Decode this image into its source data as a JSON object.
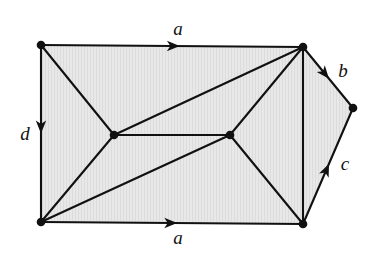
{
  "figure": {
    "name": "triangulated-polygon-with-identified-edges",
    "width": 377,
    "height": 253,
    "background_color": "#ffffff",
    "face_fill_color": "#e6e6e6",
    "stroke_color": "#111111"
  },
  "vertices": [
    {
      "id": "top-left",
      "x": 41,
      "y": 45,
      "label": ""
    },
    {
      "id": "top-right",
      "x": 303,
      "y": 47,
      "label": ""
    },
    {
      "id": "right",
      "x": 353,
      "y": 108,
      "label": ""
    },
    {
      "id": "bottom-right",
      "x": 303,
      "y": 224,
      "label": ""
    },
    {
      "id": "bottom-left",
      "x": 41,
      "y": 222,
      "label": ""
    },
    {
      "id": "interior-left",
      "x": 114,
      "y": 135,
      "label": ""
    },
    {
      "id": "interior-right",
      "x": 230,
      "y": 135,
      "label": ""
    }
  ],
  "boundary_path": "41,45 303,47 353,108 303,224 41,222",
  "edges": [
    {
      "id": "edge-top",
      "from": "top-left",
      "to": "top-right",
      "label": "a",
      "directed": true,
      "arrow_at": 0.53,
      "label_x": 178,
      "label_y": 31
    },
    {
      "id": "edge-bottom",
      "from": "bottom-left",
      "to": "bottom-right",
      "label": "a",
      "directed": true,
      "arrow_at": 0.52,
      "label_x": 178,
      "label_y": 240
    },
    {
      "id": "edge-left",
      "from": "top-left",
      "to": "bottom-left",
      "label": "d",
      "directed": true,
      "arrow_at": 0.5,
      "label_x": 25,
      "label_y": 136
    },
    {
      "id": "edge-upper-right",
      "from": "top-right",
      "to": "right",
      "label": "b",
      "directed": true,
      "arrow_at": 0.52,
      "label_x": 343,
      "label_y": 73
    },
    {
      "id": "edge-lower-right",
      "from": "bottom-right",
      "to": "right",
      "label": "c",
      "directed": true,
      "arrow_at": 0.52,
      "label_x": 345,
      "label_y": 166
    },
    {
      "id": "edge-right-vertical",
      "from": "top-right",
      "to": "bottom-right",
      "label": "",
      "directed": false
    },
    {
      "id": "edge-tl-il",
      "from": "top-left",
      "to": "interior-left",
      "label": "",
      "directed": false
    },
    {
      "id": "edge-tr-il",
      "from": "top-right",
      "to": "interior-left",
      "label": "",
      "directed": false
    },
    {
      "id": "edge-tr-ir",
      "from": "top-right",
      "to": "interior-right",
      "label": "",
      "directed": false
    },
    {
      "id": "edge-il-ir",
      "from": "interior-left",
      "to": "interior-right",
      "label": "",
      "directed": false
    },
    {
      "id": "edge-bl-il",
      "from": "bottom-left",
      "to": "interior-left",
      "label": "",
      "directed": false
    },
    {
      "id": "edge-bl-ir",
      "from": "bottom-left",
      "to": "interior-right",
      "label": "",
      "directed": false
    },
    {
      "id": "edge-br-ir",
      "from": "bottom-right",
      "to": "interior-right",
      "label": "",
      "directed": false
    }
  ],
  "labels": {
    "top": "a",
    "bottom": "a",
    "left": "d",
    "upper_right": "b",
    "lower_right": "c"
  }
}
